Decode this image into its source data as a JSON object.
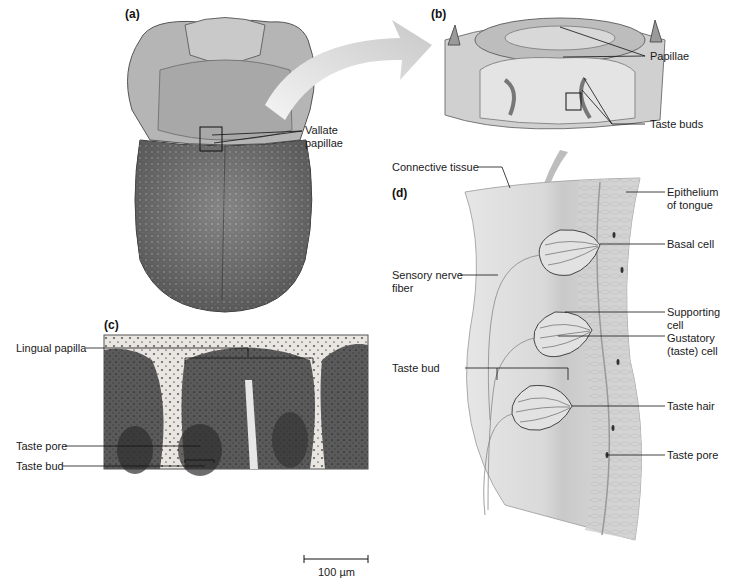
{
  "figure": {
    "panels": {
      "a": {
        "letter": "(a)",
        "labels": {
          "vallate_papillae_line1": "Vallate",
          "vallate_papillae_line2": "papillae"
        }
      },
      "b": {
        "letter": "(b)",
        "labels": {
          "papillae": "Papillae",
          "taste_buds": "Taste buds"
        }
      },
      "c": {
        "letter": "(c)",
        "labels": {
          "lingual_papilla": "Lingual papilla",
          "taste_pore": "Taste pore",
          "taste_bud": "Taste bud"
        },
        "scale_bar": "100 µm"
      },
      "d": {
        "letter": "(d)",
        "labels": {
          "connective_tissue": "Connective tissue",
          "epithelium_line1": "Epithelium",
          "epithelium_line2": "of tongue",
          "basal_cell": "Basal cell",
          "sensory_nerve_line1": "Sensory nerve",
          "sensory_nerve_line2": "fiber",
          "supporting_cell_line1": "Supporting",
          "supporting_cell_line2": "cell",
          "gustatory_line1": "Gustatory",
          "gustatory_line2": "(taste) cell",
          "taste_bud": "Taste bud",
          "taste_hair": "Taste hair",
          "taste_pore": "Taste pore"
        }
      }
    },
    "colors": {
      "ink": "#1a1a1a",
      "arrow": "#d6d6d6",
      "tissue": "#cfcfcf",
      "micrograph_dark": "#2a2a2a"
    }
  }
}
